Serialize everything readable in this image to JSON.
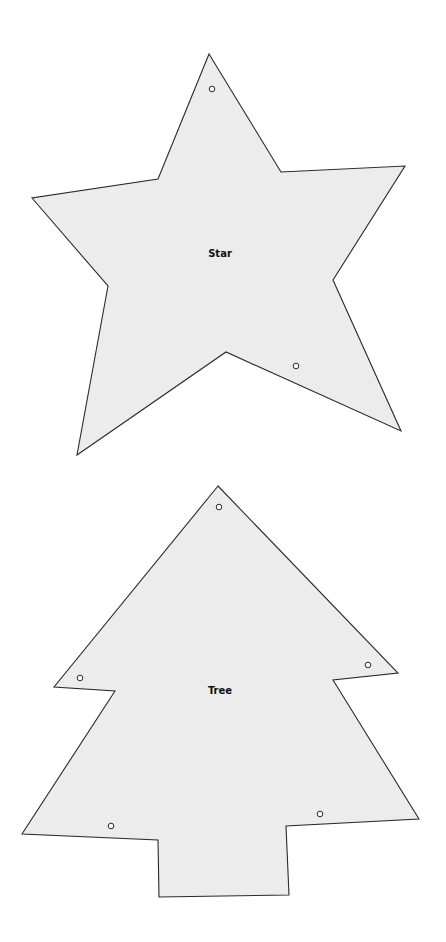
{
  "canvas": {
    "width": 446,
    "height": 942,
    "background": "#ffffff"
  },
  "style": {
    "fill": "#ececec",
    "stroke": "#2a2a2a"
  },
  "templates": [
    {
      "id": "star",
      "label": "Star",
      "label_pos": [
        220,
        253
      ],
      "points": [
        [
          209,
          54
        ],
        [
          281,
          172
        ],
        [
          405,
          166
        ],
        [
          333,
          280
        ],
        [
          401,
          431
        ],
        [
          226,
          352
        ],
        [
          77,
          455
        ],
        [
          108,
          286
        ],
        [
          32,
          198
        ],
        [
          158,
          179
        ]
      ],
      "holes": [
        [
          212,
          89
        ],
        [
          296,
          366
        ]
      ]
    },
    {
      "id": "tree",
      "label": "Tree",
      "label_pos": [
        220,
        690
      ],
      "points": [
        [
          218,
          486
        ],
        [
          398,
          673
        ],
        [
          333,
          680
        ],
        [
          419,
          819
        ],
        [
          286,
          826
        ],
        [
          289,
          895
        ],
        [
          159,
          897
        ],
        [
          158,
          840
        ],
        [
          22,
          834
        ],
        [
          115,
          691
        ],
        [
          54,
          687
        ]
      ],
      "holes": [
        [
          219,
          507
        ],
        [
          368,
          665
        ],
        [
          80,
          678
        ],
        [
          111,
          826
        ],
        [
          320,
          814
        ]
      ]
    }
  ]
}
